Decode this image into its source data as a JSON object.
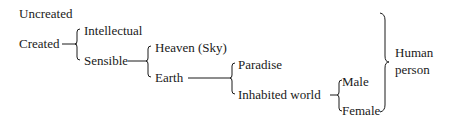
{
  "diagram": {
    "type": "classification-tree",
    "nodes": {
      "uncreated": "Uncreated",
      "created": "Created",
      "intellectual": "Intellectual",
      "sensible": "Sensible",
      "heaven": "Heaven (Sky)",
      "earth": "Earth",
      "paradise": "Paradise",
      "inhabited_world": "Inhabited world",
      "male": "Male",
      "female": "Female",
      "human_person_line1": "Human",
      "human_person_line2": "person"
    },
    "edges": [
      [
        "Created",
        "Intellectual"
      ],
      [
        "Created",
        "Sensible"
      ],
      [
        "Sensible",
        "Heaven (Sky)"
      ],
      [
        "Sensible",
        "Earth"
      ],
      [
        "Earth",
        "Paradise"
      ],
      [
        "Earth",
        "Inhabited world"
      ],
      [
        "Inhabited world",
        "Male"
      ],
      [
        "Inhabited world",
        "Female"
      ]
    ],
    "grouping_brace": {
      "label": "Human person",
      "spans": [
        "Intellectual",
        "Sensible",
        "Heaven (Sky)",
        "Earth",
        "Paradise",
        "Inhabited world",
        "Male",
        "Female"
      ]
    }
  }
}
